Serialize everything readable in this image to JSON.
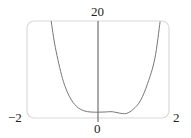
{
  "chart_data": {
    "type": "line",
    "title": "",
    "xlabel": "",
    "ylabel": "",
    "xlim": [
      -2,
      2
    ],
    "ylim": [
      0,
      20
    ],
    "grid": false,
    "legend": "none",
    "x_tick_labels": [
      {
        "value": -2,
        "label": "−2"
      },
      {
        "value": 0,
        "label": "0"
      },
      {
        "value": 2,
        "label": "2"
      }
    ],
    "y_tick_labels": [
      {
        "value": 20,
        "label": "20"
      }
    ],
    "series": [
      {
        "name": "f(x)",
        "color": "#777777",
        "x": [
          -1.32,
          -1.2,
          -1.0,
          -0.8,
          -0.6,
          -0.4,
          -0.2,
          0.0,
          0.2,
          0.4,
          0.6,
          0.8,
          1.0,
          1.2,
          1.4,
          1.6,
          1.75
        ],
        "y": [
          20.0,
          14.5,
          8.15,
          4.37,
          2.37,
          1.5,
          1.23,
          1.2,
          1.24,
          1.3,
          1.01,
          0.94,
          1.85,
          3.64,
          7.16,
          12.2,
          19.9
        ]
      }
    ],
    "frame_color": "#d9d9d9",
    "axis_color": "#555555"
  }
}
